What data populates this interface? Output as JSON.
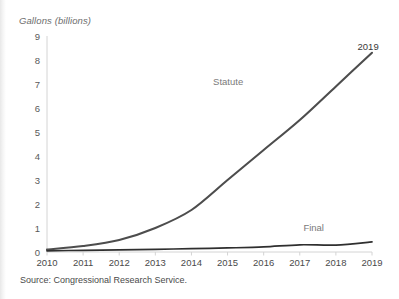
{
  "chart_data": {
    "type": "line",
    "title": "Gallons (billions)",
    "xlabel": "",
    "ylabel": "Gallons (billions)",
    "x": [
      2010,
      2011,
      2012,
      2013,
      2014,
      2015,
      2016,
      2017,
      2018,
      2019
    ],
    "categories": [
      "2010",
      "2011",
      "2012",
      "2013",
      "2014",
      "2015",
      "2016",
      "2017",
      "2018",
      "2019"
    ],
    "xlim": [
      2010,
      2019
    ],
    "ylim": [
      0,
      9
    ],
    "yticks": [
      0,
      1,
      2,
      3,
      4,
      5,
      6,
      7,
      8,
      9
    ],
    "ytick_labels": [
      "0",
      "1",
      "2",
      "3",
      "4",
      "5",
      "6",
      "7",
      "8",
      "9"
    ],
    "grid": false,
    "legend_position": "inline-labels",
    "series": [
      {
        "name": "Statute",
        "color": "#4d4d4d",
        "values": [
          0.1,
          0.25,
          0.5,
          1.0,
          1.75,
          3.0,
          4.25,
          5.5,
          6.9,
          8.3
        ]
      },
      {
        "name": "Final",
        "color": "#2f2f2f",
        "values": [
          0.05,
          0.07,
          0.09,
          0.11,
          0.14,
          0.17,
          0.21,
          0.3,
          0.29,
          0.42
        ]
      }
    ],
    "annotations": [
      {
        "text": "Statute",
        "x": 2014.6,
        "y": 7.1,
        "color": "#7a7a7a"
      },
      {
        "text": "Final",
        "x": 2017.1,
        "y": 1.0,
        "color": "#7a7a7a"
      },
      {
        "text": "2019",
        "x": 2018.6,
        "y": 8.55,
        "color": "#3a3a3a"
      }
    ]
  },
  "footer": {
    "source": "Source: Congressional Research Service."
  },
  "axis": {
    "y_label_title": "Gallons (billions)"
  }
}
